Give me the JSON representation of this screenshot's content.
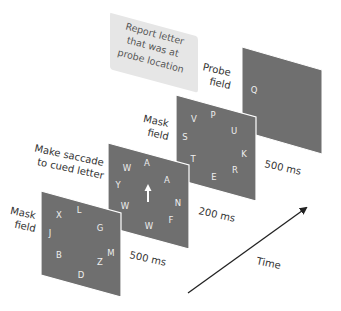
{
  "colors": {
    "panel": "#6f6f6f",
    "panel_border": "#ffffff",
    "callout_bg": "#e6e6e6",
    "text": "#333333",
    "letter": "#eeeeee",
    "arrow": "#222222"
  },
  "callout": {
    "lines": [
      "Report letter",
      "that was at",
      "probe location"
    ]
  },
  "panels": [
    {
      "id": "mask-field-1",
      "label_lines": [
        "Mask",
        "field"
      ],
      "duration": "500 ms",
      "letters": [
        {
          "ch": "X",
          "x": 59,
          "y": 218
        },
        {
          "ch": "L",
          "x": 79,
          "y": 213
        },
        {
          "ch": "G",
          "x": 100,
          "y": 231
        },
        {
          "ch": "J",
          "x": 50,
          "y": 236
        },
        {
          "ch": "M",
          "x": 111,
          "y": 256
        },
        {
          "ch": "B",
          "x": 59,
          "y": 258
        },
        {
          "ch": "Z",
          "x": 100,
          "y": 265
        },
        {
          "ch": "D",
          "x": 81,
          "y": 278
        }
      ]
    },
    {
      "id": "saccade-field",
      "label_lines": [
        "Make saccade",
        "to cued letter"
      ],
      "duration": "200 ms",
      "cue": "up-arrow",
      "letters": [
        {
          "ch": "W",
          "x": 127,
          "y": 171
        },
        {
          "ch": "A",
          "x": 147,
          "y": 166
        },
        {
          "ch": "A",
          "x": 167,
          "y": 183
        },
        {
          "ch": "Y",
          "x": 118,
          "y": 188
        },
        {
          "ch": "N",
          "x": 178,
          "y": 206
        },
        {
          "ch": "W",
          "x": 125,
          "y": 209
        },
        {
          "ch": "F",
          "x": 171,
          "y": 223
        },
        {
          "ch": "W",
          "x": 149,
          "y": 229
        }
      ]
    },
    {
      "id": "mask-field-2",
      "label_lines": [
        "Mask",
        "field"
      ],
      "duration": "500 ms",
      "letters": [
        {
          "ch": "V",
          "x": 194,
          "y": 122
        },
        {
          "ch": "P",
          "x": 213,
          "y": 118
        },
        {
          "ch": "U",
          "x": 234,
          "y": 134
        },
        {
          "ch": "S",
          "x": 185,
          "y": 140
        },
        {
          "ch": "K",
          "x": 244,
          "y": 157
        },
        {
          "ch": "T",
          "x": 193,
          "y": 162
        },
        {
          "ch": "R",
          "x": 235,
          "y": 173
        },
        {
          "ch": "E",
          "x": 214,
          "y": 180
        }
      ]
    },
    {
      "id": "probe-field",
      "label_lines": [
        "Probe",
        "field"
      ],
      "duration": "",
      "letters": [
        {
          "ch": "Q",
          "x": 254,
          "y": 93
        }
      ]
    }
  ],
  "time_axis": {
    "label": "Time"
  }
}
